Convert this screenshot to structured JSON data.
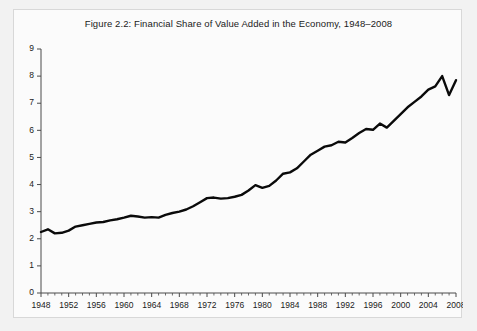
{
  "figure": {
    "panel_background": "#fbfbfb",
    "page_background": "#f2f2f2",
    "border_color": "#d8d8d8"
  },
  "chart_data": {
    "type": "line",
    "title": "Figure 2.2: Financial Share of Value Added in the Economy, 1948–2008",
    "xlabel": "",
    "ylabel": "",
    "xlim": [
      1948,
      2008
    ],
    "ylim": [
      0,
      9
    ],
    "grid": false,
    "legend": null,
    "line_color": "#0a0a0a",
    "x_major_ticks": [
      1948,
      1952,
      1956,
      1960,
      1964,
      1968,
      1972,
      1976,
      1980,
      1984,
      1988,
      1992,
      1996,
      2000,
      2004,
      2008
    ],
    "x_major_tick_labels": [
      "1948",
      "1952",
      "1956",
      "1960",
      "1964",
      "1968",
      "1972",
      "1976",
      "1980",
      "1984",
      "1988",
      "1992",
      "1996",
      "2000",
      "2004",
      "2008"
    ],
    "x_minor_tick_interval": 1,
    "y_major_ticks": [
      0,
      1,
      2,
      3,
      4,
      5,
      6,
      7,
      8,
      9
    ],
    "y_major_tick_labels": [
      "0",
      "1",
      "2",
      "3",
      "4",
      "5",
      "6",
      "7",
      "8",
      "9"
    ],
    "series": [
      {
        "name": "Financial share of value added",
        "x": [
          1948,
          1949,
          1950,
          1951,
          1952,
          1953,
          1954,
          1955,
          1956,
          1957,
          1958,
          1959,
          1960,
          1961,
          1962,
          1963,
          1964,
          1965,
          1966,
          1967,
          1968,
          1969,
          1970,
          1971,
          1972,
          1973,
          1974,
          1975,
          1976,
          1977,
          1978,
          1979,
          1980,
          1981,
          1982,
          1983,
          1984,
          1985,
          1986,
          1987,
          1988,
          1989,
          1990,
          1991,
          1992,
          1993,
          1994,
          1995,
          1996,
          1997,
          1998,
          1999,
          2000,
          2001,
          2002,
          2003,
          2004,
          2005,
          2006,
          2007,
          2008
        ],
        "values": [
          2.25,
          2.35,
          2.2,
          2.22,
          2.3,
          2.45,
          2.5,
          2.55,
          2.6,
          2.62,
          2.68,
          2.72,
          2.78,
          2.85,
          2.82,
          2.78,
          2.8,
          2.78,
          2.88,
          2.95,
          3.0,
          3.08,
          3.2,
          3.35,
          3.5,
          3.52,
          3.48,
          3.5,
          3.55,
          3.62,
          3.78,
          3.98,
          3.88,
          3.95,
          4.15,
          4.4,
          4.45,
          4.6,
          4.85,
          5.1,
          5.25,
          5.4,
          5.45,
          5.58,
          5.55,
          5.72,
          5.9,
          6.05,
          6.02,
          6.25,
          6.1,
          6.35,
          6.6,
          6.85,
          7.05,
          7.25,
          7.5,
          7.62,
          8.0,
          7.3,
          7.85
        ]
      }
    ]
  }
}
